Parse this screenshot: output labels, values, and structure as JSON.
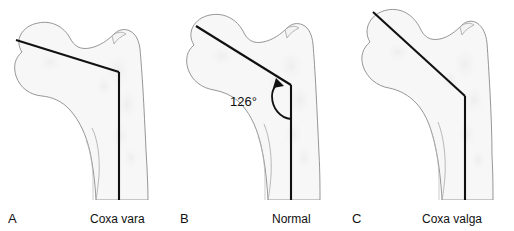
{
  "figure": {
    "background_color": "#ffffff",
    "bone_fill_color": "#f7f7f7",
    "bone_outline_color": "#8a8a8a",
    "axis_line_color": "#111111",
    "text_color": "#111111"
  },
  "panels": [
    {
      "letter": "A",
      "caption": "Coxa vara",
      "condition": "coxa vara",
      "neck_shaft_angle_label": "",
      "description": "Proximal femur with decreased neck-shaft angle"
    },
    {
      "letter": "B",
      "caption": "Normal",
      "condition": "normal",
      "neck_shaft_angle_label": "126°",
      "description": "Proximal femur with normal neck-shaft angle"
    },
    {
      "letter": "C",
      "caption": "Coxa valga",
      "condition": "coxa valga",
      "neck_shaft_angle_label": "",
      "description": "Proximal femur with increased neck-shaft angle"
    }
  ]
}
